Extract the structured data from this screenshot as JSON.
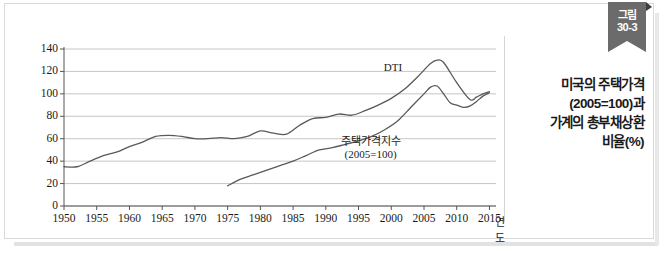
{
  "ribbon": {
    "line1": "그림",
    "line2": "30-3"
  },
  "caption": {
    "lines": [
      "미국의 주택가격",
      "(2005=100)과",
      "가계의 총부채상환",
      "비율(%)"
    ]
  },
  "colors": {
    "ribbon_bg": "#6b6b6b",
    "frame_border": "#d9d9d9",
    "gridline": "#b8b8b8",
    "axis": "#555555",
    "series_line": "#595959",
    "text": "#1a1a1a"
  },
  "chart_data": {
    "type": "line",
    "title": "",
    "xlabel": "연도",
    "ylabel": "",
    "xlim": [
      1950,
      2016
    ],
    "ylim": [
      0,
      140
    ],
    "grid": true,
    "legend": "inline-annotation",
    "ytick_labels": [
      "0",
      "20",
      "40",
      "60",
      "80",
      "100",
      "120",
      "140"
    ],
    "yticks": [
      0,
      20,
      40,
      60,
      80,
      100,
      120,
      140
    ],
    "xtick_labels": [
      "1950",
      "1955",
      "1960",
      "1965",
      "1970",
      "1975",
      "1980",
      "1985",
      "1990",
      "1995",
      "2000",
      "2005",
      "2010",
      "2015"
    ],
    "xticks": [
      1950,
      1955,
      1960,
      1965,
      1970,
      1975,
      1980,
      1985,
      1990,
      1995,
      2000,
      2005,
      2010,
      2015
    ],
    "series": [
      {
        "name": "DTI",
        "label": "DTI",
        "label_lines": [
          "DTI"
        ],
        "x": [
          1950,
          1952,
          1954,
          1956,
          1958,
          1960,
          1962,
          1964,
          1966,
          1968,
          1970,
          1972,
          1974,
          1976,
          1978,
          1980,
          1982,
          1984,
          1986,
          1988,
          1990,
          1992,
          1994,
          1996,
          1998,
          2000,
          2002,
          2004,
          2006,
          2007,
          2008,
          2010,
          2012,
          2013,
          2014,
          2015
        ],
        "values": [
          35,
          35,
          40,
          45,
          48,
          53,
          57,
          62,
          63,
          62,
          60,
          60,
          61,
          60,
          62,
          67,
          65,
          64,
          72,
          78,
          79,
          82,
          81,
          85,
          90,
          96,
          104,
          115,
          127,
          130,
          128,
          110,
          95,
          97,
          100,
          102
        ]
      },
      {
        "name": "주택가격지수",
        "label": "주택가격지수 (2005=100)",
        "label_lines": [
          "주택가격지수",
          "(2005=100)"
        ],
        "x": [
          1975,
          1977,
          1979,
          1981,
          1983,
          1985,
          1987,
          1989,
          1991,
          1993,
          1995,
          1997,
          1999,
          2001,
          2003,
          2005,
          2006,
          2007,
          2008,
          2009,
          2010,
          2011,
          2012,
          2013,
          2014,
          2015
        ],
        "values": [
          18,
          24,
          28,
          32,
          36,
          40,
          45,
          50,
          52,
          55,
          58,
          62,
          68,
          76,
          88,
          100,
          106,
          107,
          100,
          92,
          90,
          88,
          89,
          93,
          98,
          101
        ]
      }
    ]
  }
}
